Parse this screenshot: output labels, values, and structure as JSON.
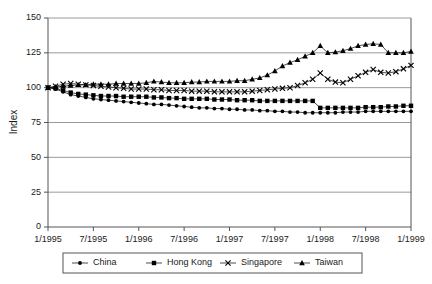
{
  "chart_data": {
    "type": "line",
    "title": "",
    "xlabel": "",
    "ylabel": "Index",
    "ylim": [
      0,
      150
    ],
    "yticks": [
      0,
      25,
      50,
      75,
      100,
      125,
      150
    ],
    "grid": true,
    "legend_position": "bottom",
    "x_tick_labels": [
      "1/1995",
      "7/1995",
      "1/1996",
      "7/1996",
      "1/1997",
      "7/1997",
      "1/1998",
      "7/1998",
      "1/1999"
    ],
    "x_tick_indices": [
      0,
      6,
      12,
      18,
      24,
      30,
      36,
      42,
      48
    ],
    "x": [
      "1/1995",
      "2/1995",
      "3/1995",
      "4/1995",
      "5/1995",
      "6/1995",
      "7/1995",
      "8/1995",
      "9/1995",
      "10/1995",
      "11/1995",
      "12/1995",
      "1/1996",
      "2/1996",
      "3/1996",
      "4/1996",
      "5/1996",
      "6/1996",
      "7/1996",
      "8/1996",
      "9/1996",
      "10/1996",
      "11/1996",
      "12/1996",
      "1/1997",
      "2/1997",
      "3/1997",
      "4/1997",
      "5/1997",
      "6/1997",
      "7/1997",
      "8/1997",
      "9/1997",
      "10/1997",
      "11/1997",
      "12/1997",
      "1/1998",
      "2/1998",
      "3/1998",
      "4/1998",
      "5/1998",
      "6/1998",
      "7/1998",
      "8/1998",
      "9/1998",
      "10/1998",
      "11/1998",
      "12/1998",
      "1/1999"
    ],
    "series": [
      {
        "name": "China",
        "marker": "dot",
        "color": "#000000",
        "values": [
          100,
          99,
          97,
          95,
          94,
          93,
          92,
          91.5,
          91,
          90.5,
          90,
          89.5,
          89,
          88.5,
          88,
          88,
          87.5,
          87,
          86.5,
          86,
          85.5,
          85.5,
          85,
          85,
          84.5,
          84.5,
          84,
          84,
          83.5,
          83.5,
          83,
          83,
          82.5,
          82.5,
          82,
          82,
          82,
          82,
          82,
          82.5,
          82.5,
          82.5,
          83,
          83,
          83,
          83,
          83,
          83,
          83
        ]
      },
      {
        "name": "Hong Kong",
        "marker": "square",
        "color": "#000000",
        "values": [
          100,
          99.5,
          98,
          96.5,
          95.5,
          95,
          94.5,
          94,
          94,
          94,
          93.5,
          93.5,
          93.5,
          93.5,
          93,
          93,
          92.5,
          92.5,
          92,
          92,
          92,
          92,
          91.5,
          91.5,
          91.5,
          91,
          91,
          91,
          90.5,
          90.5,
          90.5,
          90.5,
          90.5,
          90.5,
          90.5,
          90.5,
          85.5,
          85.5,
          85.5,
          85.5,
          85.5,
          85.5,
          86,
          86,
          86,
          86.5,
          86.5,
          87,
          87
        ]
      },
      {
        "name": "Singapore",
        "marker": "cross",
        "color": "#000000",
        "values": [
          100,
          101,
          102.5,
          103,
          102.5,
          102,
          101.5,
          101,
          100.5,
          100,
          99.5,
          99,
          99,
          99,
          98.5,
          98.5,
          98,
          98,
          98,
          97.5,
          97.5,
          97.5,
          97,
          97,
          97,
          97,
          97,
          97.5,
          98,
          98.5,
          99,
          99.5,
          100,
          101.5,
          103.5,
          106,
          110.5,
          106,
          104,
          103.5,
          106,
          108.5,
          111,
          113,
          111,
          110.5,
          111.5,
          113.5,
          116
        ]
      },
      {
        "name": "Taiwan",
        "marker": "triangle",
        "color": "#000000",
        "values": [
          100,
          100.5,
          101,
          101.5,
          102,
          102,
          102.5,
          102.5,
          102.5,
          103,
          103,
          103,
          103,
          103.5,
          104.5,
          104,
          103.5,
          103.5,
          103.5,
          104,
          104,
          104.5,
          104.5,
          104.5,
          104.5,
          105,
          105,
          106,
          107,
          109,
          112,
          115.5,
          118,
          120,
          122.5,
          125,
          130,
          125,
          125.5,
          126.5,
          128,
          130,
          131,
          131.5,
          131,
          125,
          125,
          125,
          126
        ]
      }
    ]
  },
  "legend": {
    "items": [
      {
        "label": "China",
        "marker": "dot"
      },
      {
        "label": "Hong Kong",
        "marker": "square"
      },
      {
        "label": "Singapore",
        "marker": "cross"
      },
      {
        "label": "Taiwan",
        "marker": "triangle"
      }
    ]
  },
  "axes": {
    "y_title": "Index"
  }
}
